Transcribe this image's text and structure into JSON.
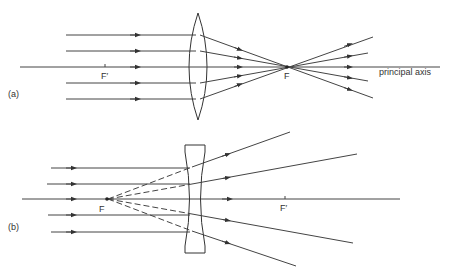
{
  "diagram": {
    "part_a": {
      "label": "(a)",
      "lens_type": "convex (converging)",
      "focal_point_label": "F",
      "second_focal_point_label": "F′",
      "axis_label": "principal axis",
      "ray_count": 5
    },
    "part_b": {
      "label": "(b)",
      "lens_type": "concave (diverging)",
      "focal_point_label": "F",
      "second_focal_point_label": "F′",
      "ray_count": 5,
      "virtual_rays": "dashed lines traced back to F"
    },
    "colors": {
      "line": "#444444",
      "text": "#333333",
      "background": "#ffffff"
    }
  }
}
